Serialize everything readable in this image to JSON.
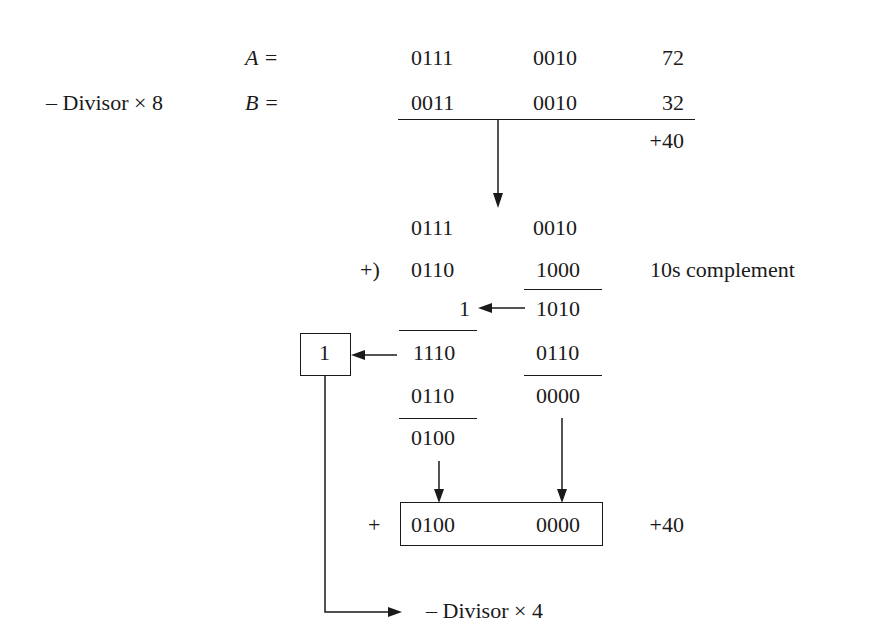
{
  "diagram": {
    "top": {
      "label_a": "A =",
      "label_b": "B =",
      "divisor_label": "– Divisor × 8",
      "row_a": {
        "high": "0111",
        "low": "0010",
        "decimal": "72"
      },
      "row_b": {
        "high": "0011",
        "low": "0010",
        "decimal": "32"
      },
      "difference": "+40"
    },
    "addition": {
      "row1": {
        "high": "0111",
        "low": "0010"
      },
      "operator": "+)",
      "row2": {
        "high": "0110",
        "low": "1000"
      },
      "note": "10s complement",
      "low_sum": "1010",
      "carry": "1",
      "high_sum": "1110",
      "low_correction": "0110",
      "carry_out": "1",
      "high_correction": "0110",
      "low_result": "0000",
      "high_result": "0100"
    },
    "result": {
      "sign": "+",
      "high": "0100",
      "low": "0000",
      "decimal": "+40"
    },
    "bottom_label": "– Divisor × 4"
  }
}
